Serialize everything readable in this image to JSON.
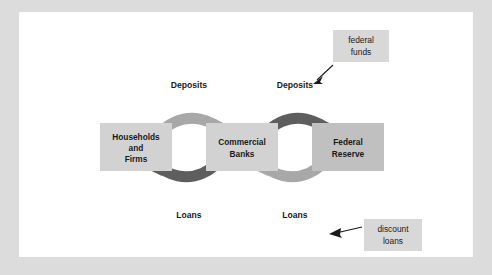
{
  "figure": {
    "type": "economics-flow-diagram",
    "background_color": "#dcdcdc",
    "panel_color": "#ffffff"
  },
  "colors": {
    "box_fill_light": "#d2d2d2",
    "box_fill_dark": "#c0c0c0",
    "arrow_light": "#a8a8a8",
    "arrow_dark": "#5e5e5e",
    "callout_fill": "#d8d8d8",
    "text": "#1a1a1a"
  },
  "nodes": [
    {
      "id": "households-and-firms",
      "lines": [
        "Households",
        "and",
        "Firms"
      ],
      "x": 80,
      "y": 110,
      "width": 72,
      "height": 48,
      "fill": "#d2d2d2"
    },
    {
      "id": "commercial-banks",
      "lines": [
        "Commercial",
        "Banks"
      ],
      "x": 186,
      "y": 110,
      "width": 72,
      "height": 48,
      "fill": "#d2d2d2"
    },
    {
      "id": "federal-reserve",
      "lines": [
        "Federal",
        "Reserve"
      ],
      "x": 292,
      "y": 110,
      "width": 72,
      "height": 48,
      "fill": "#c0c0c0"
    }
  ],
  "loops": [
    {
      "id": "households-banks-loop",
      "center_x": 169,
      "center_y": 134,
      "top_label": "Deposits",
      "bottom_label": "Loans",
      "top_arc_color": "#a8a8a8",
      "bottom_arc_color": "#5e5e5e",
      "top_direction": "clockwise-to-right",
      "bottom_direction": "counter-to-left"
    },
    {
      "id": "banks-fed-loop",
      "center_x": 275,
      "center_y": 134,
      "top_label": "Deposits",
      "bottom_label": "Loans",
      "top_arc_color": "#5e5e5e",
      "bottom_arc_color": "#a8a8a8",
      "top_direction": "clockwise-to-right",
      "bottom_direction": "counter-to-left"
    }
  ],
  "callouts": [
    {
      "id": "federal-funds-callout",
      "lines": [
        "federal",
        "funds"
      ],
      "x": 313,
      "y": 17,
      "width": 56,
      "height": 32,
      "points_to": "Deposits",
      "arrow_from_x": 313,
      "arrow_from_y": 53,
      "arrow_to_x": 294,
      "arrow_to_y": 70
    },
    {
      "id": "discount-loans-callout",
      "lines": [
        "discount",
        "loans"
      ],
      "x": 344,
      "y": 206,
      "width": 58,
      "height": 32,
      "points_to": "Loans",
      "arrow_from_x": 342,
      "arrow_from_y": 214,
      "arrow_to_x": 313,
      "arrow_to_y": 220
    }
  ],
  "flow_labels": [
    {
      "id": "deposits-left",
      "text": "Deposits",
      "x": 169,
      "y": 72
    },
    {
      "id": "deposits-right",
      "text": "Deposits",
      "x": 275,
      "y": 72
    },
    {
      "id": "loans-left",
      "text": "Loans",
      "x": 169,
      "y": 201
    },
    {
      "id": "loans-right",
      "text": "Loans",
      "x": 275,
      "y": 201
    }
  ]
}
